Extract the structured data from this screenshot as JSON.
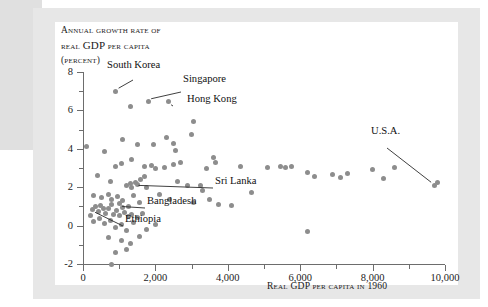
{
  "figure": {
    "title_lines": [
      "Annual growth rate of",
      "real GDP per capita",
      "(percent)"
    ],
    "title_line1": "Annual growth rate of",
    "title_line2a": "real ",
    "title_line2b": "GDP",
    "title_line2c": " per capita",
    "title_line3": "(percent)",
    "xaxis_title": "Real GDP per capita in 1960"
  },
  "chart_data": {
    "type": "scatter",
    "title": "Annual growth rate of real GDP per capita (percent)",
    "xlabel": "Real GDP per capita in 1960",
    "ylabel": "Annual growth rate of real GDP per capita (percent)",
    "xlim": [
      0,
      10000
    ],
    "ylim": [
      -2,
      8
    ],
    "grid": false,
    "legend": "none",
    "xticks": [
      0,
      2000,
      4000,
      6000,
      8000,
      10000
    ],
    "xtick_labels": [
      "0",
      "2,000",
      "4,000",
      "6,000",
      "8,000",
      "10,000"
    ],
    "xticks_minor": [
      1000,
      3000,
      5000,
      7000,
      9000
    ],
    "yticks": [
      -2,
      0,
      2,
      4,
      6,
      8
    ],
    "ytick_labels": [
      "-2",
      "0",
      "2",
      "4",
      "6",
      "8"
    ],
    "yticks_minor": [
      -1,
      1,
      3,
      5,
      7
    ],
    "marker_color": "#8d8d8d",
    "points": [
      [
        900,
        7.0
      ],
      [
        1300,
        6.2
      ],
      [
        1800,
        6.45
      ],
      [
        2350,
        6.45
      ],
      [
        3050,
        5.4
      ],
      [
        3000,
        4.75
      ],
      [
        100,
        4.1
      ],
      [
        1100,
        4.5
      ],
      [
        1500,
        4.2
      ],
      [
        1950,
        4.25
      ],
      [
        2300,
        4.6
      ],
      [
        2500,
        4.3
      ],
      [
        2550,
        3.9
      ],
      [
        600,
        3.85
      ],
      [
        900,
        3.1
      ],
      [
        1050,
        3.25
      ],
      [
        1350,
        3.45
      ],
      [
        1700,
        3.1
      ],
      [
        1900,
        3.15
      ],
      [
        2000,
        2.95
      ],
      [
        2250,
        3.05
      ],
      [
        2500,
        3.2
      ],
      [
        2700,
        3.3
      ],
      [
        3400,
        3.0
      ],
      [
        3600,
        3.55
      ],
      [
        3650,
        3.3
      ],
      [
        400,
        2.6
      ],
      [
        750,
        2.3
      ],
      [
        1200,
        2.1
      ],
      [
        1300,
        2.2
      ],
      [
        1350,
        2.0
      ],
      [
        1450,
        2.25
      ],
      [
        1500,
        2.15
      ],
      [
        1600,
        2.4
      ],
      [
        1700,
        2.55
      ],
      [
        1750,
        2.0
      ],
      [
        2600,
        2.3
      ],
      [
        2900,
        2.1
      ],
      [
        3250,
        2.1
      ],
      [
        3300,
        1.85
      ],
      [
        4350,
        3.1
      ],
      [
        5100,
        3.05
      ],
      [
        5450,
        3.1
      ],
      [
        5600,
        3.05
      ],
      [
        5750,
        3.1
      ],
      [
        6200,
        2.75
      ],
      [
        6400,
        2.55
      ],
      [
        6900,
        2.65
      ],
      [
        7100,
        2.5
      ],
      [
        7300,
        2.7
      ],
      [
        8000,
        2.9
      ],
      [
        8300,
        2.45
      ],
      [
        8600,
        3.05
      ],
      [
        9700,
        2.1
      ],
      [
        9800,
        2.25
      ],
      [
        300,
        1.55
      ],
      [
        500,
        1.45
      ],
      [
        700,
        1.6
      ],
      [
        800,
        1.35
      ],
      [
        950,
        1.5
      ],
      [
        1000,
        1.15
      ],
      [
        1100,
        1.3
      ],
      [
        1250,
        1.0
      ],
      [
        1400,
        1.55
      ],
      [
        1550,
        1.2
      ],
      [
        2100,
        1.6
      ],
      [
        2400,
        1.35
      ],
      [
        3050,
        1.2
      ],
      [
        3500,
        1.35
      ],
      [
        250,
        0.85
      ],
      [
        350,
        1.0
      ],
      [
        420,
        0.75
      ],
      [
        480,
        1.05
      ],
      [
        560,
        0.9
      ],
      [
        620,
        0.65
      ],
      [
        700,
        0.9
      ],
      [
        780,
        1.1
      ],
      [
        850,
        0.6
      ],
      [
        920,
        0.8
      ],
      [
        1000,
        0.55
      ],
      [
        1080,
        0.95
      ],
      [
        1150,
        0.7
      ],
      [
        1250,
        0.45
      ],
      [
        1350,
        0.6
      ],
      [
        1500,
        0.4
      ],
      [
        1650,
        0.65
      ],
      [
        200,
        0.55
      ],
      [
        300,
        0.2
      ],
      [
        450,
        0.35
      ],
      [
        600,
        0.1
      ],
      [
        760,
        0.25
      ],
      [
        900,
        -0.1
      ],
      [
        1050,
        0.05
      ],
      [
        1200,
        -0.25
      ],
      [
        1400,
        0.15
      ],
      [
        1750,
        -0.2
      ],
      [
        2000,
        0.05
      ],
      [
        4650,
        1.7
      ],
      [
        4100,
        1.05
      ],
      [
        3750,
        1.1
      ],
      [
        6200,
        -0.3
      ],
      [
        700,
        -0.6
      ],
      [
        1050,
        -0.75
      ],
      [
        1300,
        -0.95
      ],
      [
        1550,
        -0.55
      ],
      [
        900,
        -1.4
      ],
      [
        1200,
        -1.25
      ],
      [
        800,
        -2.0
      ]
    ],
    "annotations": [
      {
        "label": "South Korea",
        "point": [
          900,
          7.0
        ]
      },
      {
        "label": "Singapore",
        "point": [
          1800,
          6.45
        ]
      },
      {
        "label": "Hong Kong",
        "point": [
          2350,
          6.45
        ]
      },
      {
        "label": "Sri Lanka",
        "point": [
          1450,
          2.25
        ]
      },
      {
        "label": "Bangladesh",
        "point": [
          1000,
          1.15
        ]
      },
      {
        "label": "Ethiopia",
        "point": [
          250,
          0.85
        ]
      },
      {
        "label": "U.S.A.",
        "point": [
          9700,
          2.1
        ]
      }
    ]
  },
  "annotations": {
    "south_korea": "South Korea",
    "singapore": "Singapore",
    "hong_kong": "Hong Kong",
    "sri_lanka": "Sri Lanka",
    "bangladesh": "Bangladesh",
    "ethiopia": "Ethiopia",
    "usa": "U.S.A."
  }
}
